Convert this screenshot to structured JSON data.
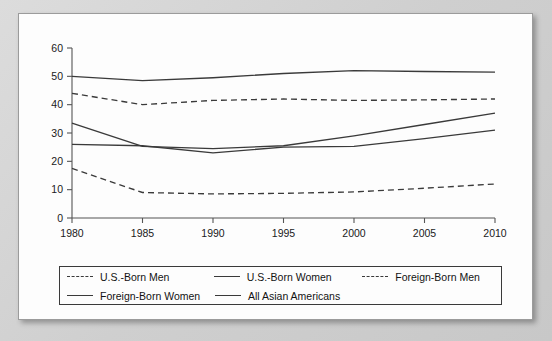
{
  "chart_data": {
    "type": "line",
    "title": "",
    "xlabel": "",
    "ylabel": "",
    "x": [
      1980,
      1985,
      1990,
      1995,
      2000,
      2005,
      2010
    ],
    "xticklabels": [
      "1980",
      "1985",
      "1990",
      "1995",
      "2000",
      "2005",
      "2010"
    ],
    "yticklabels": [
      "0",
      "10",
      "20",
      "30",
      "40",
      "50",
      "60"
    ],
    "ylim": [
      0,
      60
    ],
    "xlim": [
      1980,
      2010
    ],
    "ytick_step": 10,
    "grid": false,
    "legend_position": "below-axes",
    "series": [
      {
        "name": "U.S.-Born Men",
        "style": "dashed",
        "values": [
          44.0,
          40.0,
          41.5,
          42.0,
          41.5,
          41.7,
          42.0
        ]
      },
      {
        "name": "U.S.-Born Women",
        "style": "solid",
        "values": [
          33.5,
          25.3,
          24.5,
          25.5,
          29.0,
          33.0,
          37.0
        ]
      },
      {
        "name": "Foreign-Born Men",
        "style": "dashed",
        "values": [
          17.5,
          9.0,
          8.5,
          8.7,
          9.2,
          10.5,
          12.0
        ]
      },
      {
        "name": "Foreign-Born Women",
        "style": "solid",
        "values": [
          26.0,
          25.5,
          23.0,
          25.0,
          25.3,
          28.0,
          31.0
        ]
      },
      {
        "name": "All Asian Americans",
        "style": "solid",
        "values": [
          50.0,
          48.5,
          49.5,
          51.0,
          52.0,
          51.7,
          51.5
        ]
      }
    ]
  },
  "legend": {
    "rows": [
      [
        {
          "label": "U.S.-Born Men",
          "style": "dashed"
        },
        {
          "label": "U.S.-Born Women",
          "style": "solid"
        },
        {
          "label": "Foreign-Born Men",
          "style": "dashed"
        }
      ],
      [
        {
          "label": "Foreign-Born Women",
          "style": "solid"
        },
        {
          "label": "All Asian Americans",
          "style": "solid"
        }
      ]
    ]
  },
  "colors": {
    "line": "#3a3a3a",
    "axis": "#555555",
    "panel_background": "#fdfdfd",
    "page_background": "#d6d6d6",
    "text": "#131313"
  }
}
